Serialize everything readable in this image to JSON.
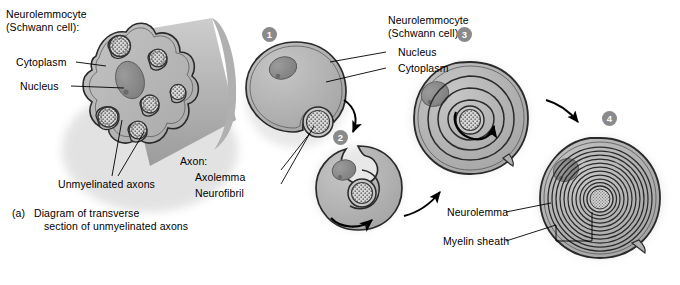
{
  "figure": {
    "background_color": "#ffffff",
    "ink_color": "#000000",
    "cell_fill": "#b9b9b9",
    "cell_fill_dark": "#9a9a9a",
    "nucleus_fill": "#8f8f8f",
    "axon_fill": "#cfcfcf",
    "badge_fill": "#8a8a8a",
    "badge_text_color": "#ffffff"
  },
  "panel_a": {
    "labels": {
      "cell_title_line1": "Neurolemmocyte",
      "cell_title_line2": "(Schwann cell):",
      "cytoplasm": "Cytoplasm",
      "nucleus": "Nucleus",
      "unmyelinated_axons": "Unmyelinated axons"
    },
    "caption": {
      "marker": "(a)",
      "line1": "Diagram of transverse",
      "line2": "section of unmyelinated axons"
    },
    "axon_count": 6
  },
  "panel_b": {
    "labels": {
      "cell_title_line1": "Neurolemmocyte",
      "cell_title_line2": "(Schwann cell):",
      "nucleus": "Nucleus",
      "cytoplasm": "Cytoplasm",
      "axon_title": "Axon:",
      "axolemma": "Axolemma",
      "neurofibril": "Neurofibril",
      "neurolemma": "Neurolemma",
      "myelin_sheath": "Myelin sheath"
    },
    "steps": [
      {
        "number": "1",
        "description": "Neurolemmocyte begins to envelop the axon"
      },
      {
        "number": "2",
        "description": "Neurolemmocyte rotates around the axon"
      },
      {
        "number": "3",
        "description": "Layers of membrane wrap around the axon"
      },
      {
        "number": "4",
        "description": "Mature myelin sheath with neurolemma"
      }
    ],
    "wrap_turns": {
      "step1": 0,
      "step2": 1,
      "step3": 3,
      "step4": 10
    }
  }
}
